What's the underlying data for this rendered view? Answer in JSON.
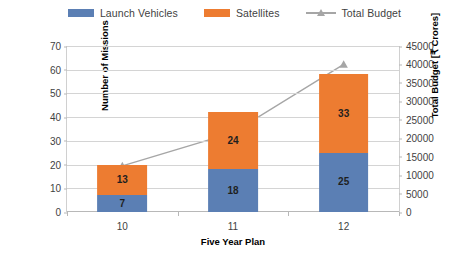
{
  "chart_data": {
    "type": "bar",
    "subtype": "stacked-bar-with-line-combo",
    "title": "",
    "xlabel": "Five Year Plan",
    "ylabel": "Number of Missions",
    "y2label": "Total Budget [₹ Crores]",
    "categories": [
      "10",
      "11",
      "12"
    ],
    "ylim": [
      0,
      70
    ],
    "yticks": [
      0,
      10,
      20,
      30,
      40,
      50,
      60,
      70
    ],
    "y2lim": [
      0,
      45000
    ],
    "y2ticks": [
      0,
      5000,
      10000,
      15000,
      20000,
      25000,
      30000,
      35000,
      40000,
      45000
    ],
    "grid": true,
    "legend_position": "top",
    "series": [
      {
        "name": "Launch Vehicles",
        "type": "bar",
        "axis": "left",
        "color": "#5B7FB4",
        "values": [
          7,
          18,
          25
        ],
        "labels": [
          "7",
          "18",
          "25"
        ]
      },
      {
        "name": "Satellites",
        "type": "bar",
        "axis": "left",
        "color": "#ED7C31",
        "values": [
          13,
          24,
          33
        ],
        "labels": [
          "13",
          "24",
          "33"
        ]
      },
      {
        "name": "Total Budget",
        "type": "line",
        "axis": "right",
        "color": "#A6A6A6",
        "marker": "triangle",
        "values": [
          12500,
          21500,
          40000
        ]
      }
    ],
    "stack_totals": [
      20,
      42,
      58
    ]
  },
  "legend": {
    "entries": [
      {
        "label": "Launch Vehicles",
        "color": "#5B7FB4",
        "kind": "swatch"
      },
      {
        "label": "Satellites",
        "color": "#ED7C31",
        "kind": "swatch"
      },
      {
        "label": "Total Budget",
        "color": "#A6A6A6",
        "kind": "line-marker"
      }
    ]
  },
  "axes": {
    "left": {
      "title": "Number of Missions",
      "ticks": [
        "0",
        "10",
        "20",
        "30",
        "40",
        "50",
        "60",
        "70"
      ]
    },
    "right": {
      "title": "Total Budget [₹ Crores]",
      "ticks": [
        "0",
        "5000",
        "10000",
        "15000",
        "20000",
        "25000",
        "30000",
        "35000",
        "40000",
        "45000"
      ]
    },
    "bottom": {
      "title": "Five Year Plan",
      "ticks": [
        "10",
        "11",
        "12"
      ]
    }
  },
  "colors": {
    "launch_vehicles": "#5B7FB4",
    "satellites": "#ED7C31",
    "total_budget_line": "#A6A6A6",
    "gridline": "#D4D4D4",
    "axis": "#B8B8B8",
    "text": "#3F3F3F",
    "background": "#FFFFFF"
  }
}
